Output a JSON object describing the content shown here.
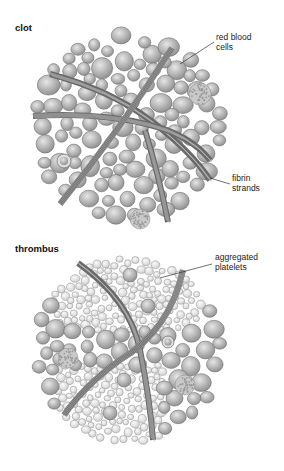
{
  "panels": [
    {
      "id": "clot",
      "title": "clot",
      "labels": [
        {
          "id": "red-blood-cells",
          "line1": "red blood",
          "line2": "cells"
        },
        {
          "id": "fibrin-strands",
          "line1": "fibrin",
          "line2": "strands"
        }
      ]
    },
    {
      "id": "thrombus",
      "title": "thrombus",
      "labels": [
        {
          "id": "aggregated-platelets",
          "line1": "aggregated",
          "line2": "platelets"
        }
      ]
    }
  ],
  "colors": {
    "background": "#ffffff",
    "cell_fill_light": "#e6e6e6",
    "cell_fill_dark": "#8c8c8c",
    "cell_stroke": "#6e6e6e",
    "platelet_fill": "#efefef",
    "platelet_stroke": "#9a9a9a",
    "strand": "#6a6a6a",
    "leader_line": "#333333"
  }
}
